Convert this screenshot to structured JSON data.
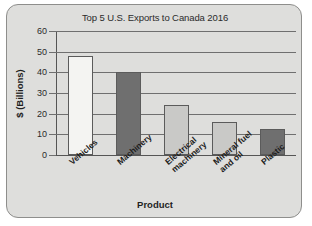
{
  "frame": {
    "accent": "#dededc",
    "border_color": "#8e8e8c"
  },
  "chart_data": {
    "type": "bar",
    "title": "Top 5 U.S. Exports to Canada 2016",
    "xlabel": "Product",
    "ylabel": "$ (Billions)",
    "categories": [
      "Vehicles",
      "Machinery",
      "Electrical machinery",
      "Mineral fuel and oil",
      "Plastic"
    ],
    "category_lines": [
      [
        "Vehicles"
      ],
      [
        "Machinery"
      ],
      [
        "Electrical",
        "machinery"
      ],
      [
        "Mineral fuel",
        "and oil"
      ],
      [
        "Plastic"
      ]
    ],
    "values": [
      48,
      40,
      24,
      16,
      12.5
    ],
    "bar_colors": [
      "#f4f4f2",
      "#6f6f6f",
      "#c9c9c7",
      "#c9c9c7",
      "#6f6f6f"
    ],
    "ylim": [
      0,
      60
    ],
    "yticks": [
      0,
      10,
      20,
      30,
      40,
      50,
      60
    ],
    "ytick_labels": [
      "0",
      "10",
      "20",
      "30",
      "40",
      "50",
      "60"
    ],
    "grid": true,
    "legend": "none"
  }
}
